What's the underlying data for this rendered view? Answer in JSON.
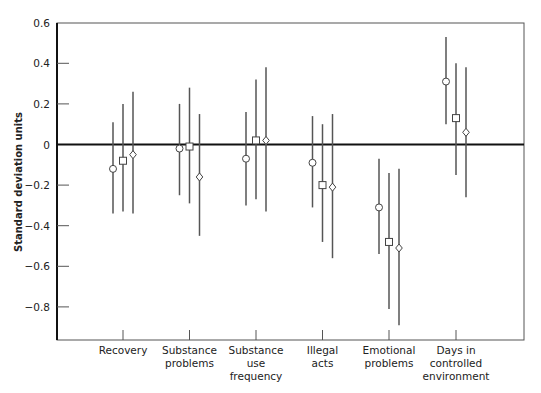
{
  "chart_data": {
    "type": "errorbar",
    "title": "",
    "xlabel": "",
    "ylabel": "Standard deviation units",
    "ylim": [
      -0.96,
      0.6
    ],
    "yticks": [
      "0.6",
      "0.4",
      "0.2",
      "0",
      "-0.2",
      "-0.4",
      "-0.6",
      "-0.8"
    ],
    "ytick_values": [
      0.6,
      0.4,
      0.2,
      0,
      -0.2,
      -0.4,
      -0.6,
      -0.8
    ],
    "grid": false,
    "reference_line": 0,
    "categories": [
      "Recovery",
      "Substance\nproblems",
      "Substance\nuse\nfrequency",
      "Illegal\nacts",
      "Emotional\nproblems",
      "Days in\ncontrolled\nenvironment"
    ],
    "marker_legend": [
      "circle",
      "square",
      "diamond"
    ],
    "series": [
      {
        "name": "circle",
        "marker": "circle",
        "values": [
          -0.12,
          -0.02,
          -0.07,
          -0.09,
          -0.31,
          0.31
        ],
        "upper": [
          0.11,
          0.2,
          0.16,
          0.14,
          -0.07,
          0.53
        ],
        "lower": [
          -0.34,
          -0.25,
          -0.3,
          -0.31,
          -0.54,
          0.1
        ]
      },
      {
        "name": "square",
        "marker": "square",
        "values": [
          -0.08,
          -0.01,
          0.02,
          -0.2,
          -0.48,
          0.13
        ],
        "upper": [
          0.2,
          0.28,
          0.32,
          0.1,
          -0.14,
          0.4
        ],
        "lower": [
          -0.33,
          -0.29,
          -0.27,
          -0.48,
          -0.81,
          -0.15
        ]
      },
      {
        "name": "diamond",
        "marker": "diamond",
        "values": [
          -0.05,
          -0.16,
          0.02,
          -0.21,
          -0.51,
          0.06
        ],
        "upper": [
          0.26,
          0.15,
          0.38,
          0.15,
          -0.12,
          0.38
        ],
        "lower": [
          -0.34,
          -0.45,
          -0.33,
          -0.56,
          -0.89,
          -0.26
        ]
      }
    ]
  }
}
